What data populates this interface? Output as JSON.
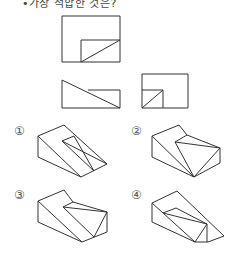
{
  "question": {
    "text": "•가장 적합한 것은?"
  },
  "views": {
    "top_view": "top-view-drawing",
    "front_view": "front-view-drawing",
    "side_view": "side-view-drawing"
  },
  "options": [
    {
      "label": "①",
      "x": 14,
      "y": 124
    },
    {
      "label": "②",
      "x": 131,
      "y": 124
    },
    {
      "label": "③",
      "x": 14,
      "y": 188
    },
    {
      "label": "④",
      "x": 131,
      "y": 188
    }
  ],
  "stroke_color": "#333333"
}
